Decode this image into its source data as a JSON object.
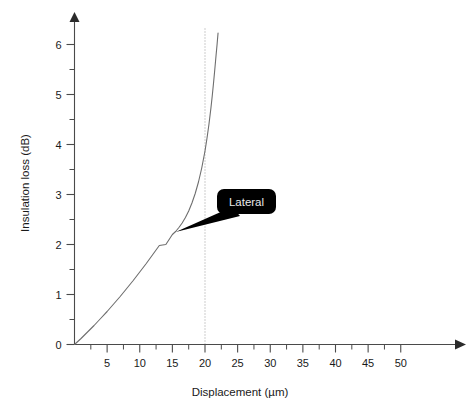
{
  "chart_data": {
    "type": "line",
    "title": "",
    "xlabel": "Displacement (µm)",
    "ylabel": "Insulation loss (dB)",
    "xlim": [
      0,
      52
    ],
    "ylim": [
      0,
      6.4
    ],
    "grid": false,
    "legend_position": "inline-callout",
    "x_ticks": [
      5,
      10,
      15,
      20,
      25,
      30,
      35,
      40,
      45,
      50
    ],
    "x_tick_labels": [
      "5",
      "10",
      "15",
      "20",
      "25",
      "30",
      "35",
      "40",
      "45",
      "50"
    ],
    "x_minor_tick_step": 2.5,
    "y_ticks": [
      0,
      1,
      2,
      3,
      4,
      5,
      6
    ],
    "y_tick_labels": [
      "0",
      "1",
      "2",
      "3",
      "4",
      "5",
      "6"
    ],
    "y_minor_tick_step": 0.5,
    "series": [
      {
        "name": "Lateral",
        "color": "#6e6e6e",
        "x": [
          0.0,
          1.0,
          2.0,
          3.0,
          4.0,
          5.0,
          6.0,
          7.0,
          8.0,
          9.0,
          10.0,
          11.0,
          12.0,
          13.0,
          14.0,
          15.0,
          15.5,
          16.0,
          16.5,
          17.0,
          17.5,
          18.0,
          18.5,
          19.0,
          19.5,
          20.0,
          20.3,
          20.6,
          20.9,
          21.1,
          21.3,
          21.5,
          21.7,
          21.85,
          22.0
        ],
        "y": [
          0.0,
          0.12,
          0.25,
          0.38,
          0.52,
          0.66,
          0.81,
          0.96,
          1.12,
          1.28,
          1.45,
          1.62,
          1.8,
          1.98,
          2.0,
          2.2,
          2.26,
          2.34,
          2.43,
          2.54,
          2.67,
          2.83,
          3.02,
          3.25,
          3.53,
          3.87,
          4.12,
          4.4,
          4.72,
          4.96,
          5.22,
          5.5,
          5.79,
          6.0,
          6.23
        ]
      }
    ],
    "annotations": [
      {
        "label": "Lateral",
        "type": "callout",
        "box_fill": "#000000",
        "text_color": "#e8e8e8",
        "anchor_x": 15.5,
        "anchor_y": 2.25
      },
      {
        "label": "",
        "type": "vertical-reference-line",
        "style": "dotted",
        "color": "#9a9a9a",
        "x": 20
      }
    ]
  },
  "axis": {
    "x_title": "Displacement (µm)",
    "y_title": "Insulation loss (dB)",
    "x_labels": [
      "5",
      "10",
      "15",
      "20",
      "25",
      "30",
      "35",
      "40",
      "45",
      "50"
    ],
    "y_labels": [
      "0",
      "1",
      "2",
      "3",
      "4",
      "5",
      "6"
    ]
  },
  "callout": {
    "label": "Lateral"
  },
  "colors": {
    "curve": "#6e6e6e",
    "axis": "#4a4a4a",
    "text": "#1a1a1a",
    "callout_fill": "#000000",
    "callout_text": "#e8e8e8",
    "reference_line": "#9a9a9a",
    "background": "#ffffff"
  }
}
